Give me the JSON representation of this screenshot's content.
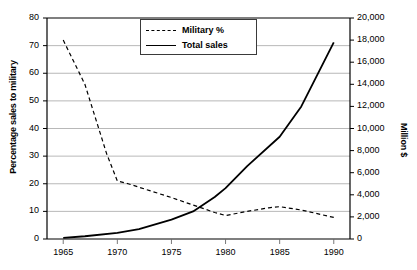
{
  "chart_data": {
    "type": "line",
    "title": "",
    "xlabel": "",
    "x": [
      1965,
      1970,
      1975,
      1980,
      1985,
      1990
    ],
    "xlim": [
      1963.5,
      1991.5
    ],
    "xticks": [
      "1965",
      "1970",
      "1975",
      "1980",
      "1985",
      "1990"
    ],
    "grid": true,
    "legend_position": "top-center",
    "axes": [
      {
        "id": "left",
        "label": "Percentage sales to military",
        "lim": [
          0,
          80
        ],
        "ticks": [
          "0",
          "10",
          "20",
          "30",
          "40",
          "50",
          "60",
          "70",
          "80"
        ],
        "tick_values": [
          0,
          10,
          20,
          30,
          40,
          50,
          60,
          70,
          80
        ]
      },
      {
        "id": "right",
        "label": "Million $",
        "lim": [
          0,
          20000
        ],
        "ticks": [
          "0",
          "2,000",
          "4,000",
          "6,000",
          "8,000",
          "10,000",
          "12,000",
          "14,000",
          "16,000",
          "18,000",
          "20,000"
        ],
        "tick_values": [
          0,
          2000,
          4000,
          6000,
          8000,
          10000,
          12000,
          14000,
          16000,
          18000,
          20000
        ]
      }
    ],
    "series": [
      {
        "name": "Military %",
        "axis": "left",
        "style": "dashed",
        "color": "#000000",
        "x": [
          1965,
          1967,
          1969,
          1970,
          1971,
          1973,
          1975,
          1977,
          1979,
          1980,
          1982,
          1984,
          1985,
          1987,
          1990
        ],
        "values": [
          72,
          56,
          31,
          21,
          20,
          17.5,
          15,
          12.3,
          9.6,
          8.5,
          10,
          11.3,
          11.7,
          10.5,
          7.8
        ]
      },
      {
        "name": "Total sales",
        "axis": "right",
        "style": "solid",
        "color": "#000000",
        "x": [
          1965,
          1967,
          1970,
          1972,
          1975,
          1977,
          1979,
          1980,
          1982,
          1985,
          1987,
          1990
        ],
        "values": [
          100,
          250,
          550,
          900,
          1750,
          2500,
          3800,
          4600,
          6600,
          9250,
          12000,
          17800
        ]
      }
    ]
  },
  "legend": {
    "items": [
      {
        "label": "Military %",
        "style": "dashed"
      },
      {
        "label": "Total sales",
        "style": "solid"
      }
    ]
  }
}
